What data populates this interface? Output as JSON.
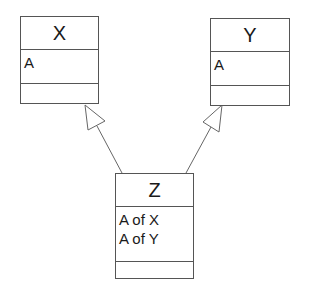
{
  "diagram": {
    "type": "uml-class-diagram",
    "classes": [
      {
        "id": "X",
        "name": "X",
        "attributes": [
          "A"
        ],
        "methods": []
      },
      {
        "id": "Y",
        "name": "Y",
        "attributes": [
          "A"
        ],
        "methods": []
      },
      {
        "id": "Z",
        "name": "Z",
        "attributes": [
          "A of X",
          "A of Y"
        ],
        "methods": []
      }
    ],
    "relationships": [
      {
        "type": "generalization",
        "from": "Z",
        "to": "X"
      },
      {
        "type": "generalization",
        "from": "Z",
        "to": "Y"
      }
    ],
    "colors": {
      "line": "#555555",
      "text": "#1a1a1a",
      "background": "#ffffff"
    }
  }
}
